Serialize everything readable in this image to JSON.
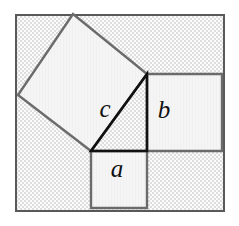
{
  "figure": {
    "background_color": "#ffffff",
    "panel_fill_color": "#f2f2f2",
    "panel_pattern": "fine-checker",
    "panel_pattern_color": "#dcdcdc",
    "square_fill_color": "#f4f4f4",
    "square_stroke_color": "#6b6b6b",
    "triangle_stroke_color": "#111111",
    "frame_stroke_color": "#595959",
    "label_color": "#111111"
  },
  "panel": {
    "name": "checkered-background-panel",
    "x": 15,
    "y": 14,
    "width": 210,
    "height": 198,
    "stroke_width": 2
  },
  "triangle": {
    "name": "right-triangle",
    "stroke_width": 2.6,
    "vertices": [
      {
        "id": "right-angle-vertex",
        "x": 147,
        "y": 151
      },
      {
        "id": "top-vertex",
        "x": 147,
        "y": 74
      },
      {
        "id": "left-vertex",
        "x": 91,
        "y": 151
      }
    ],
    "sides": [
      {
        "id": "side-a",
        "label": "a",
        "from": "left-vertex",
        "to": "right-angle-vertex",
        "orientation": "horizontal"
      },
      {
        "id": "side-b",
        "label": "b",
        "from": "right-angle-vertex",
        "to": "top-vertex",
        "orientation": "vertical"
      },
      {
        "id": "side-c",
        "label": "c",
        "from": "top-vertex",
        "to": "left-vertex",
        "orientation": "hypotenuse"
      }
    ]
  },
  "squares": [
    {
      "id": "square-a",
      "label": "a",
      "on_side": "side-a",
      "kind": "axis-aligned",
      "points": "91,151 147,151 147,208 91,208",
      "stroke_width": 2.4,
      "label_x": 117,
      "label_y": 177,
      "label_font_size": 25
    },
    {
      "id": "square-b",
      "label": "b",
      "on_side": "side-b",
      "kind": "axis-aligned",
      "points": "147,74 222,74 222,151 147,151",
      "stroke_width": 2.4,
      "label_x": 164,
      "label_y": 118,
      "label_font_size": 25
    },
    {
      "id": "square-c",
      "label": "c",
      "on_side": "side-c",
      "kind": "rotated",
      "points": "147,74 91,151 18,95 73,14",
      "stroke_width": 2.4,
      "label_x": 105,
      "label_y": 117,
      "label_font_size": 25
    }
  ],
  "labels": {
    "a": "a",
    "b": "b",
    "c": "c"
  }
}
